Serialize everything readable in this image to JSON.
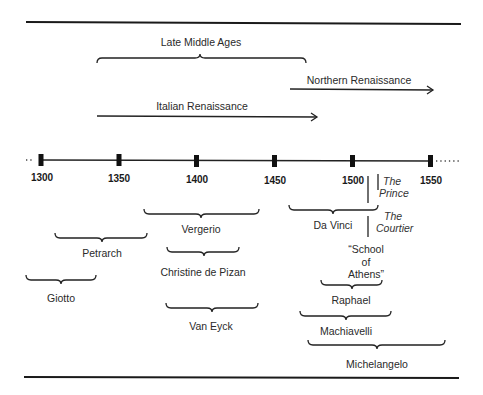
{
  "timeline": {
    "years": [
      "1300",
      "1350",
      "1400",
      "1450",
      "1500",
      "1550"
    ]
  },
  "periods": {
    "late_middle_ages": "Late Middle Ages",
    "northern_renaissance": "Northern Renaissance",
    "italian_renaissance": "Italian Renaissance"
  },
  "figures": {
    "vergerio": "Vergerio",
    "petrarch": "Petrarch",
    "christine": "Christine de Pizan",
    "giotto": "Giotto",
    "van_eyck": "Van Eyck",
    "da_vinci": "Da Vinci",
    "raphael": "Raphael",
    "machiavelli": "Machiavelli",
    "michelangelo": "Michelangelo"
  },
  "works": {
    "prince_line1": "The",
    "prince_line2": "Prince",
    "courtier_line1": "The",
    "courtier_line2": "Courtier",
    "school_line1": "“School",
    "school_line2": "of",
    "school_line3": "Athens”"
  }
}
